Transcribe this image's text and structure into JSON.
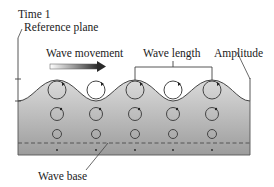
{
  "labels": {
    "time": "Time 1",
    "reference_plane": "Reference plane",
    "wave_movement": "Wave movement",
    "wave_length": "Wave length",
    "amplitude": "Amplitude",
    "wave_base": "Wave base"
  },
  "colors": {
    "water_top": "#d2d2d2",
    "water_bottom": "#9a9a9a",
    "stroke": "#333333",
    "arrow_dark": "#333333",
    "arrow_light": "#ffffff"
  },
  "orbits": {
    "columns_x": [
      57,
      96,
      135,
      173,
      212
    ],
    "rows": [
      {
        "y": 90,
        "r": 9
      },
      {
        "y": 114,
        "r": 6.5
      },
      {
        "y": 134,
        "r": 4.5
      },
      {
        "y": 150,
        "r": 0.8
      }
    ]
  }
}
